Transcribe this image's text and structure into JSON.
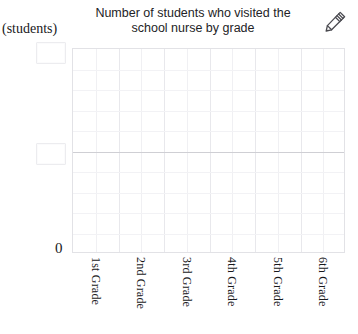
{
  "chart_data": {
    "type": "bar",
    "title": "Number of students who visited the school nurse by grade",
    "title_line1": "Number of students who visited the",
    "title_line2": "school nurse by grade",
    "xlabel": "",
    "ylabel": "(students)",
    "categories": [
      "1st Grade",
      "2nd Grade",
      "3rd Grade",
      "4th Grade",
      "5th Grade",
      "6th Grade"
    ],
    "values": [
      null,
      null,
      null,
      null,
      null,
      null
    ],
    "y_tick_labels": [
      "",
      "",
      "0"
    ],
    "grid": true,
    "legend": null,
    "note": "Empty chart template; no bars drawn and y-axis scale values are blank editable boxes."
  },
  "axis": {
    "unit_label": "(students)",
    "zero_label": "0",
    "value_top": "",
    "value_mid": "",
    "value_placeholder": ""
  },
  "toolbar": {
    "edit_icon": "pencil-icon"
  },
  "grid": {
    "vertical_cells": 12,
    "horizontal_cells": 10,
    "midline_index": 5
  },
  "colors": {
    "background": "#ffffff",
    "text": "#232326",
    "grid_minor": "#f2f2f5",
    "grid_major": "#e8e8ec",
    "grid_mid": "#cfcfd4",
    "plot_border": "#e2e2e6",
    "input_border": "#ececef",
    "icon": "#4a4a50"
  }
}
